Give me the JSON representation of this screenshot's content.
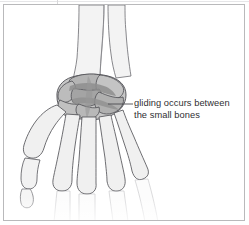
{
  "figure": {
    "background_color": "#ffffff",
    "frame_color": "#b9b9bb"
  },
  "annotation": {
    "label_text": "gliding occurs between\nthe small bones",
    "line_1": "gliding occurs between",
    "line_2": "the small bones",
    "text_color": "#2f2f33",
    "leader_line_color": "#4a4a4f"
  },
  "illustration": {
    "name": "hand-wrist-skeleton",
    "outline_color": "#55555a",
    "bone_fill": "#f0f0f0",
    "carpal_fill": "#c9c9c9",
    "carpal_highlight": "#9b9b9b",
    "faded_bone_fill": "#f7f7f7",
    "parts": [
      {
        "name": "radius",
        "label": "radius"
      },
      {
        "name": "ulna",
        "label": "ulna"
      },
      {
        "name": "carpal-bones",
        "label": "carpal bones"
      },
      {
        "name": "metacarpals",
        "label": "metacarpals"
      },
      {
        "name": "thumb-metacarpal",
        "label": "thumb metacarpal"
      },
      {
        "name": "proximal-phalanges",
        "label": "proximal phalanges"
      }
    ]
  }
}
